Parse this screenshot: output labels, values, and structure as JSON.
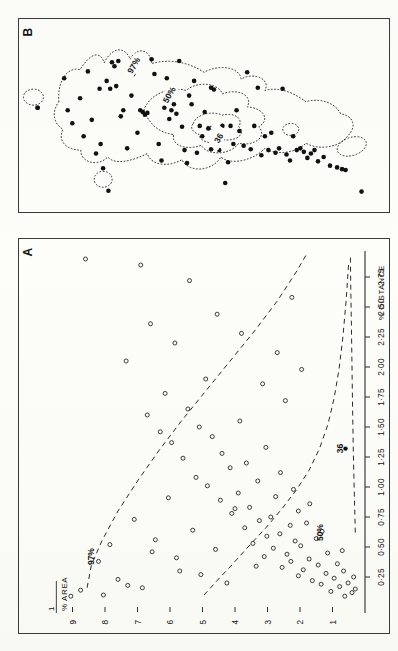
{
  "figure": {
    "panels": [
      {
        "id": "B",
        "label": "B"
      },
      {
        "id": "A",
        "label": "A"
      }
    ]
  },
  "panelA": {
    "label": "A",
    "xaxis": {
      "name": "% DISTANCE",
      "ticks": [
        "0·25",
        "0·50",
        "0·75",
        "1·00",
        "1·25",
        "1·50",
        "1·75",
        "2·00",
        "2·25",
        "2·50",
        "2·75"
      ],
      "tick_values": [
        0.25,
        0.5,
        0.75,
        1.0,
        1.25,
        1.5,
        1.75,
        2.0,
        2.25,
        2.5,
        2.75
      ],
      "range": [
        0.0,
        2.95
      ]
    },
    "yaxis": {
      "name_numerator": "1",
      "name_denominator": "% AREA",
      "ticks": [
        "1",
        "2",
        "3",
        "4",
        "5",
        "6",
        "7",
        "8",
        "9"
      ],
      "tick_values": [
        1,
        2,
        3,
        4,
        5,
        6,
        7,
        8,
        9
      ],
      "range": [
        0,
        9.6
      ]
    },
    "curve_labels": [
      {
        "text": "97%",
        "x": 0.42,
        "y": 8.35
      },
      {
        "text": "50%",
        "x": 0.62,
        "y": 1.28
      },
      {
        "text": "36",
        "x": 1.32,
        "y": 0.68
      }
    ],
    "annotations": [
      {
        "text": "36",
        "type": "filled-point",
        "x": 1.32,
        "y": 0.6
      }
    ]
  },
  "panelB": {
    "label": "B",
    "contour_labels": [
      {
        "text": "97%",
        "x": 0.305,
        "y": 0.215
      },
      {
        "text": "50%",
        "x": 0.405,
        "y": 0.385
      },
      {
        "text": "36",
        "x": 0.545,
        "y": 0.635
      }
    ],
    "markers": [
      {
        "text": "×",
        "x": 0.515,
        "y": 0.575
      }
    ]
  },
  "chart_data": [
    {
      "type": "scatter",
      "panel": "A",
      "title": "A",
      "xlabel": "% DISTANCE",
      "ylabel": "1 / % AREA",
      "xlim": [
        0.0,
        2.95
      ],
      "ylim": [
        0.0,
        9.6
      ],
      "grid": false,
      "legend": "none",
      "marker_style": "open-circle",
      "xticks": [
        0.25,
        0.5,
        0.75,
        1.0,
        1.25,
        1.5,
        1.75,
        2.0,
        2.25,
        2.5,
        2.75
      ],
      "xticklabels": [
        "0·25",
        "0·50",
        "0·75",
        "1·00",
        "1·25",
        "1·50",
        "1·75",
        "2·00",
        "2·25",
        "2·50",
        "2·75"
      ],
      "yticks": [
        1,
        2,
        3,
        4,
        5,
        6,
        7,
        8,
        9
      ],
      "yticklabels": [
        "1",
        "2",
        "3",
        "4",
        "5",
        "6",
        "7",
        "8",
        "9"
      ],
      "points": [
        [
          0.09,
          0.62
        ],
        [
          0.12,
          0.4
        ],
        [
          0.13,
          1.05
        ],
        [
          0.15,
          0.3
        ],
        [
          0.17,
          0.78
        ],
        [
          0.19,
          1.35
        ],
        [
          0.2,
          0.52
        ],
        [
          0.22,
          1.62
        ],
        [
          0.24,
          0.95
        ],
        [
          0.25,
          0.35
        ],
        [
          0.26,
          2.05
        ],
        [
          0.28,
          1.2
        ],
        [
          0.3,
          0.66
        ],
        [
          0.31,
          1.9
        ],
        [
          0.33,
          2.55
        ],
        [
          0.35,
          1.44
        ],
        [
          0.36,
          0.85
        ],
        [
          0.38,
          2.28
        ],
        [
          0.4,
          1.72
        ],
        [
          0.42,
          3.1
        ],
        [
          0.44,
          2.4
        ],
        [
          0.45,
          1.15
        ],
        [
          0.47,
          0.7
        ],
        [
          0.49,
          2.82
        ],
        [
          0.51,
          1.98
        ],
        [
          0.53,
          3.45
        ],
        [
          0.55,
          2.15
        ],
        [
          0.57,
          1.5
        ],
        [
          0.59,
          3.02
        ],
        [
          0.61,
          2.62
        ],
        [
          0.63,
          1.32
        ],
        [
          0.66,
          3.7
        ],
        [
          0.68,
          2.3
        ],
        [
          0.7,
          1.8
        ],
        [
          0.72,
          3.25
        ],
        [
          0.75,
          2.9
        ],
        [
          0.78,
          4.1
        ],
        [
          0.8,
          2.05
        ],
        [
          0.83,
          3.55
        ],
        [
          0.86,
          1.7
        ],
        [
          0.89,
          4.45
        ],
        [
          0.92,
          2.75
        ],
        [
          0.95,
          3.9
        ],
        [
          0.98,
          2.2
        ],
        [
          1.01,
          4.85
        ],
        [
          1.05,
          3.3
        ],
        [
          1.08,
          5.2
        ],
        [
          1.12,
          2.6
        ],
        [
          1.16,
          4.15
        ],
        [
          1.2,
          3.65
        ],
        [
          1.24,
          5.6
        ],
        [
          1.28,
          4.4
        ],
        [
          1.33,
          3.05
        ],
        [
          1.37,
          5.95
        ],
        [
          1.42,
          4.7
        ],
        [
          1.46,
          6.3
        ],
        [
          1.5,
          5.1
        ],
        [
          1.55,
          3.85
        ],
        [
          1.6,
          6.7
        ],
        [
          1.65,
          5.45
        ],
        [
          0.2,
          4.25
        ],
        [
          0.27,
          5.05
        ],
        [
          0.34,
          3.35
        ],
        [
          0.41,
          5.8
        ],
        [
          0.48,
          4.6
        ],
        [
          0.56,
          6.45
        ],
        [
          0.64,
          5.3
        ],
        [
          0.73,
          7.1
        ],
        [
          0.82,
          4.0
        ],
        [
          0.91,
          6.05
        ],
        [
          0.16,
          6.85
        ],
        [
          0.23,
          7.6
        ],
        [
          0.3,
          5.7
        ],
        [
          0.38,
          8.2
        ],
        [
          0.46,
          6.55
        ],
        [
          0.1,
          8.05
        ],
        [
          0.14,
          8.75
        ],
        [
          0.18,
          7.3
        ],
        [
          0.09,
          9.05
        ],
        [
          0.52,
          7.85
        ],
        [
          1.72,
          2.45
        ],
        [
          1.86,
          3.15
        ],
        [
          1.98,
          1.95
        ],
        [
          2.12,
          2.7
        ],
        [
          2.28,
          3.8
        ],
        [
          2.44,
          4.55
        ],
        [
          2.58,
          2.25
        ],
        [
          2.72,
          5.4
        ],
        [
          2.85,
          6.9
        ],
        [
          2.9,
          8.6
        ],
        [
          1.78,
          6.15
        ],
        [
          1.9,
          4.9
        ],
        [
          2.05,
          7.35
        ],
        [
          2.2,
          5.85
        ],
        [
          2.36,
          6.6
        ]
      ],
      "curves": [
        {
          "name": "97%",
          "style": "dashed",
          "label": "97%"
        },
        {
          "name": "50%",
          "style": "dashed",
          "label": "50%"
        },
        {
          "name": "36",
          "style": "dashed",
          "label": "36"
        }
      ]
    },
    {
      "type": "scatter",
      "panel": "B",
      "title": "B",
      "xlabel": "",
      "ylabel": "",
      "grid": false,
      "legend": "none",
      "marker_style": "filled-circle",
      "contours": [
        {
          "name": "97%",
          "style": "dotted"
        },
        {
          "name": "50%",
          "style": "dotted"
        },
        {
          "name": "36",
          "style": "dotted"
        }
      ],
      "points": [
        [
          0.03,
          0.455
        ],
        [
          0.105,
          0.285
        ],
        [
          0.115,
          0.47
        ],
        [
          0.128,
          0.545
        ],
        [
          0.15,
          0.4
        ],
        [
          0.16,
          0.62
        ],
        [
          0.172,
          0.245
        ],
        [
          0.183,
          0.525
        ],
        [
          0.195,
          0.72
        ],
        [
          0.205,
          0.345
        ],
        [
          0.215,
          0.805
        ],
        [
          0.208,
          0.665
        ],
        [
          0.225,
          0.3
        ],
        [
          0.235,
          0.345
        ],
        [
          0.24,
          0.192
        ],
        [
          0.247,
          0.215
        ],
        [
          0.252,
          0.33
        ],
        [
          0.258,
          0.185
        ],
        [
          0.265,
          0.505
        ],
        [
          0.272,
          0.47
        ],
        [
          0.283,
          0.69
        ],
        [
          0.295,
          0.385
        ],
        [
          0.3,
          0.262
        ],
        [
          0.312,
          0.6
        ],
        [
          0.32,
          0.47
        ],
        [
          0.327,
          0.48
        ],
        [
          0.333,
          0.495
        ],
        [
          0.34,
          0.485
        ],
        [
          0.352,
          0.175
        ],
        [
          0.36,
          0.26
        ],
        [
          0.372,
          0.665
        ],
        [
          0.38,
          0.76
        ],
        [
          0.388,
          0.455
        ],
        [
          0.395,
          0.285
        ],
        [
          0.402,
          0.52
        ],
        [
          0.408,
          0.47
        ],
        [
          0.415,
          0.435
        ],
        [
          0.422,
          0.49
        ],
        [
          0.43,
          0.185
        ],
        [
          0.438,
          0.565
        ],
        [
          0.445,
          0.7
        ],
        [
          0.452,
          0.775
        ],
        [
          0.458,
          0.385
        ],
        [
          0.465,
          0.435
        ],
        [
          0.472,
          0.3
        ],
        [
          0.48,
          0.715
        ],
        [
          0.488,
          0.56
        ],
        [
          0.495,
          0.62
        ],
        [
          0.502,
          0.48
        ],
        [
          0.512,
          0.575
        ],
        [
          0.52,
          0.695
        ],
        [
          0.528,
          0.35
        ],
        [
          0.536,
          0.62
        ],
        [
          0.543,
          0.7
        ],
        [
          0.552,
          0.56
        ],
        [
          0.56,
          0.89
        ],
        [
          0.568,
          0.77
        ],
        [
          0.575,
          0.56
        ],
        [
          0.583,
          0.665
        ],
        [
          0.592,
          0.47
        ],
        [
          0.6,
          0.59
        ],
        [
          0.612,
          0.675
        ],
        [
          0.622,
          0.25
        ],
        [
          0.632,
          0.695
        ],
        [
          0.642,
          0.56
        ],
        [
          0.652,
          0.34
        ],
        [
          0.662,
          0.73
        ],
        [
          0.672,
          0.62
        ],
        [
          0.682,
          0.7
        ],
        [
          0.69,
          0.6
        ],
        [
          0.702,
          0.715
        ],
        [
          0.712,
          0.69
        ],
        [
          0.722,
          0.345
        ],
        [
          0.733,
          0.725
        ],
        [
          0.743,
          0.76
        ],
        [
          0.752,
          0.62
        ],
        [
          0.762,
          0.7
        ],
        [
          0.772,
          0.69
        ],
        [
          0.782,
          0.71
        ],
        [
          0.792,
          0.745
        ],
        [
          0.802,
          0.72
        ],
        [
          0.812,
          0.7
        ],
        [
          0.822,
          0.765
        ],
        [
          0.838,
          0.74
        ],
        [
          0.856,
          0.79
        ],
        [
          0.876,
          0.8
        ],
        [
          0.89,
          0.81
        ],
        [
          0.9,
          0.815
        ],
        [
          0.945,
          0.94
        ],
        [
          0.23,
          0.935
        ],
        [
          0.03,
          0.455
        ],
        [
          0.52,
          0.34
        ]
      ]
    }
  ]
}
